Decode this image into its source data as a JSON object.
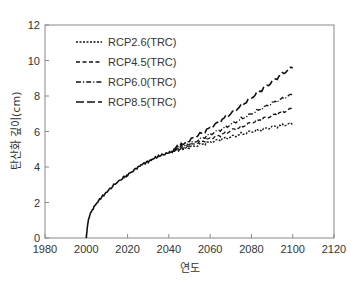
{
  "chart_data": {
    "type": "line",
    "title": "",
    "xlabel": "연도",
    "ylabel": "탄산화 깊이(cm)",
    "xlim": [
      1980,
      2120
    ],
    "ylim": [
      0,
      12
    ],
    "xticks": [
      1980,
      2000,
      2020,
      2040,
      2060,
      2080,
      2100,
      2120
    ],
    "yticks": [
      0,
      2,
      4,
      6,
      8,
      10,
      12
    ],
    "grid": false,
    "legend_position": "upper left",
    "common_series": {
      "name": "shared (2000-2042)",
      "x": [
        2000,
        2000.5,
        2001,
        2002,
        2004,
        2007,
        2010,
        2014,
        2018,
        2020,
        2024,
        2027,
        2030,
        2033,
        2036,
        2040,
        2042
      ],
      "y": [
        0,
        0.6,
        1.0,
        1.4,
        1.8,
        2.25,
        2.6,
        3.05,
        3.4,
        3.55,
        3.9,
        4.15,
        4.3,
        4.5,
        4.65,
        4.8,
        4.9
      ]
    },
    "series": [
      {
        "name": "RCP2.6(TRC)",
        "dash": "2,1.5",
        "x": [
          2042,
          2046,
          2050,
          2055,
          2060,
          2065,
          2070,
          2075,
          2080,
          2085,
          2090,
          2095,
          2100
        ],
        "y": [
          4.9,
          5.0,
          5.1,
          5.25,
          5.4,
          5.55,
          5.7,
          5.85,
          6.0,
          6.1,
          6.25,
          6.35,
          6.45
        ]
      },
      {
        "name": "RCP4.5(TRC)",
        "dash": "4,2.5",
        "x": [
          2042,
          2046,
          2050,
          2055,
          2060,
          2065,
          2070,
          2075,
          2080,
          2085,
          2090,
          2095,
          2100
        ],
        "y": [
          4.9,
          5.05,
          5.2,
          5.4,
          5.6,
          5.8,
          6.05,
          6.25,
          6.5,
          6.7,
          6.9,
          7.1,
          7.3
        ]
      },
      {
        "name": "RCP6.0(TRC)",
        "dash": "5,2,1.2,2",
        "x": [
          2042,
          2046,
          2050,
          2055,
          2060,
          2065,
          2070,
          2075,
          2080,
          2085,
          2090,
          2095,
          2100
        ],
        "y": [
          4.95,
          5.15,
          5.3,
          5.55,
          5.85,
          6.1,
          6.4,
          6.7,
          7.0,
          7.3,
          7.6,
          7.85,
          8.1
        ]
      },
      {
        "name": "RCP8.5(TRC)",
        "dash": "8,3",
        "x": [
          2042,
          2046,
          2050,
          2055,
          2060,
          2065,
          2070,
          2075,
          2080,
          2085,
          2090,
          2095,
          2100
        ],
        "y": [
          5.0,
          5.25,
          5.5,
          5.85,
          6.2,
          6.6,
          7.0,
          7.45,
          7.9,
          8.35,
          8.8,
          9.25,
          9.65
        ]
      }
    ]
  },
  "legend": {
    "items": [
      {
        "label": "RCP2.6(TRC)"
      },
      {
        "label": "RCP4.5(TRC)"
      },
      {
        "label": "RCP6.0(TRC)"
      },
      {
        "label": "RCP8.5(TRC)"
      }
    ]
  },
  "axes": {
    "x_label": "연도",
    "y_label": "탄산화 깊이(cm)",
    "x_ticks": [
      "1980",
      "2000",
      "2020",
      "2040",
      "2060",
      "2080",
      "2100",
      "2120"
    ],
    "y_ticks": [
      "0",
      "2",
      "4",
      "6",
      "8",
      "10",
      "12"
    ]
  },
  "colors": {
    "line": "#111111",
    "axis": "#888888",
    "text": "#333333"
  }
}
